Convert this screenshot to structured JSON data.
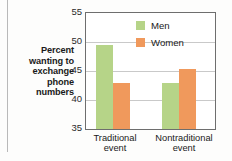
{
  "chart_data": {
    "type": "bar",
    "title": "",
    "xlabel": "",
    "ylabel": "Percent wanting to exchange phone numbers",
    "categories": [
      "Traditional event",
      "Nontraditional event"
    ],
    "category_lines": [
      [
        "Traditional",
        "event"
      ],
      [
        "Nontraditional",
        "event"
      ]
    ],
    "series": [
      {
        "name": "Men",
        "color": "#b6d488",
        "values": [
          49.4,
          43.0
        ]
      },
      {
        "name": "Women",
        "color": "#f0995c",
        "values": [
          43.0,
          45.3
        ]
      }
    ],
    "ylim": [
      35,
      55
    ],
    "yticks": [
      55,
      50,
      45,
      40,
      35
    ],
    "ytick_labels": [
      "55",
      "50",
      "45",
      "40",
      "35"
    ],
    "grid": true,
    "grid_axis": "y",
    "legend_position": "top-right",
    "legend": [
      {
        "label": "Men",
        "color": "#b6d488"
      },
      {
        "label": "Women",
        "color": "#f0995c"
      }
    ]
  },
  "axis_title_lines": [
    "Percent",
    "wanting to",
    "exchange",
    "phone",
    "numbers"
  ]
}
